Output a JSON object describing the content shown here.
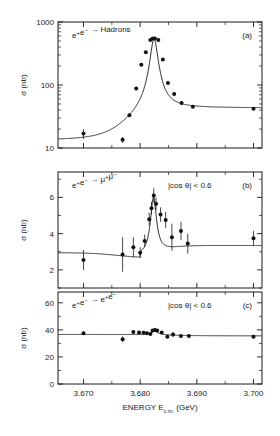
{
  "figure": {
    "xlabel_main": "ENERGY E",
    "xlabel_sub": "c.m.",
    "xlabel_unit": "(GeV)",
    "ylabel": "σ (nb)",
    "xticklabels": [
      "3.670",
      "3.680",
      "3.690",
      "3.700"
    ],
    "xticks": [
      3.67,
      3.68,
      3.69,
      3.7
    ],
    "xlim": [
      3.6655,
      3.7015
    ],
    "ink": "#1a1a1a"
  },
  "chart_data": [
    {
      "type": "scatter",
      "panel": "a",
      "panel_label": "(a)",
      "reaction": "e⁺e⁻ → Hadrons",
      "cut": "",
      "title": "",
      "xlabel": "ENERGY E_c.m. (GeV)",
      "ylabel": "σ (nb)",
      "yscale": "log",
      "ylim": [
        10,
        1000
      ],
      "yticks": [
        10,
        100,
        1000
      ],
      "yticklabels": [
        "10",
        "100",
        "1000"
      ],
      "grid": false,
      "legend": "none",
      "x": [
        3.67,
        3.6769,
        3.6781,
        3.6793,
        3.6802,
        3.681,
        3.6818,
        3.6822,
        3.6826,
        3.6832,
        3.684,
        3.6849,
        3.686,
        3.6873,
        3.6893,
        3.7
      ],
      "values": [
        17.0,
        13.5,
        33.0,
        88.0,
        210.0,
        330.0,
        520.0,
        545.0,
        545.0,
        520.0,
        255.0,
        108.0,
        72.0,
        52.0,
        45.0,
        42.0
      ],
      "yerr": [
        3.0,
        1.5,
        2.0,
        4.0,
        8.0,
        10.0,
        14.0,
        14.0,
        14.0,
        14.0,
        8.0,
        4.0,
        3.0,
        2.5,
        2.0,
        2.0
      ],
      "curve_note": "Breit-Wigner resonance fit peaking near 3.6824 GeV"
    },
    {
      "type": "scatter",
      "panel": "b",
      "panel_label": "(b)",
      "reaction": "e⁺e⁻ → μ⁺μ⁻",
      "cut": "|cos θ| < 0.6",
      "title": "",
      "xlabel": "ENERGY E_c.m. (GeV)",
      "ylabel": "σ (nb)",
      "yscale": "linear",
      "ylim": [
        1.0,
        7.4
      ],
      "yticks": [
        2,
        4,
        6
      ],
      "yticklabels": [
        "2",
        "4",
        "6"
      ],
      "grid": false,
      "legend": "none",
      "x": [
        3.67,
        3.6769,
        3.6788,
        3.68,
        3.6808,
        3.6816,
        3.682,
        3.6824,
        3.6828,
        3.6836,
        3.6845,
        3.6856,
        3.6872,
        3.6884,
        3.7
      ],
      "values": [
        2.55,
        2.85,
        3.25,
        2.95,
        3.6,
        4.8,
        5.4,
        6.1,
        5.65,
        5.05,
        4.75,
        3.8,
        4.15,
        3.45,
        3.75
      ],
      "yerr": [
        0.55,
        0.95,
        0.55,
        0.3,
        0.35,
        0.35,
        0.35,
        0.4,
        0.35,
        0.4,
        0.45,
        0.75,
        0.5,
        0.55,
        0.4
      ]
    },
    {
      "type": "scatter",
      "panel": "c",
      "panel_label": "(c)",
      "reaction": "e⁺e⁻ → e⁺e⁻",
      "cut": "|cos θ| < 0.6",
      "title": "",
      "xlabel": "ENERGY E_c.m. (GeV)",
      "ylabel": "σ (nb)",
      "yscale": "linear",
      "ylim": [
        0,
        68
      ],
      "yticks": [
        0,
        20,
        40,
        60
      ],
      "yticklabels": [
        "0",
        "20",
        "40",
        "60"
      ],
      "grid": false,
      "legend": "none",
      "x": [
        3.67,
        3.6769,
        3.6788,
        3.6798,
        3.6806,
        3.6812,
        3.6818,
        3.6822,
        3.6826,
        3.683,
        3.6838,
        3.6848,
        3.6858,
        3.6872,
        3.6886,
        3.7
      ],
      "values": [
        37.5,
        33.0,
        38.5,
        38.0,
        37.8,
        37.5,
        37.0,
        39.5,
        40.0,
        39.5,
        38.0,
        35.0,
        36.5,
        35.5,
        35.5,
        35.0
      ],
      "yerr": [
        1.2,
        2.2,
        1.2,
        1.0,
        1.0,
        1.0,
        1.0,
        1.0,
        1.0,
        1.0,
        1.0,
        1.0,
        1.8,
        1.0,
        1.0,
        1.2
      ]
    }
  ]
}
